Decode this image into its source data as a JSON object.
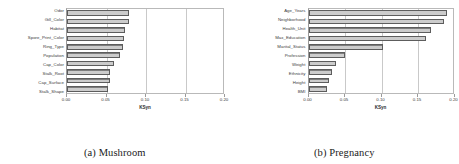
{
  "figure": {
    "subfigures": [
      {
        "caption": "(a) Mushroom",
        "chart_data": {
          "type": "bar",
          "orientation": "horizontal",
          "title": "",
          "xlabel": "KSyn",
          "ylabel": "",
          "xlim": [
            0.0,
            0.2
          ],
          "xticks": [
            "0.00",
            "0.05",
            "0.10",
            "0.15",
            "0.20"
          ],
          "xtick_values": [
            0.0,
            0.05,
            0.1,
            0.15,
            0.2
          ],
          "grid": "vertical",
          "legend": "none",
          "bar_color": "#8f8f8f",
          "bar_edge_color": "#5d5d5d",
          "categories": [
            "Odor",
            "Gill_Color",
            "Habitat",
            "Spore_Print_Color",
            "Ring_Type",
            "Population",
            "Cap_Color",
            "Stalk_Root",
            "Cap_Surface",
            "Stalk_Shape"
          ],
          "values": [
            0.079,
            0.078,
            0.074,
            0.072,
            0.071,
            0.067,
            0.06,
            0.055,
            0.054,
            0.052
          ]
        }
      },
      {
        "caption": "(b) Pregnancy",
        "chart_data": {
          "type": "bar",
          "orientation": "horizontal",
          "title": "",
          "xlabel": "KSyn",
          "ylabel": "",
          "xlim": [
            0.0,
            0.2
          ],
          "xticks": [
            "0.00",
            "0.05",
            "0.10",
            "0.15",
            "0.20"
          ],
          "xtick_values": [
            0.0,
            0.05,
            0.1,
            0.15,
            0.2
          ],
          "grid": "vertical",
          "legend": "none",
          "bar_color": "#8f8f8f",
          "bar_edge_color": "#5d5d5d",
          "categories": [
            "Age_Years",
            "Neighborhood",
            "Health_Unit",
            "Max_Education",
            "Marital_Status",
            "Profession",
            "Weight",
            "Ethnicity",
            "Height",
            "BMI"
          ],
          "values": [
            0.19,
            0.185,
            0.168,
            0.161,
            0.102,
            0.05,
            0.038,
            0.032,
            0.028,
            0.025
          ]
        }
      }
    ]
  }
}
